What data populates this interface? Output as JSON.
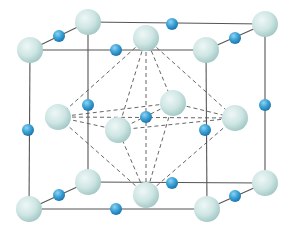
{
  "diagram": {
    "type": "crystal-unit-cell",
    "colors": {
      "background": "#ffffff",
      "cell_edge": "#555555",
      "dashed_line": "#555555",
      "large_atom": "#cfe6e4",
      "large_atom_shade": "#9fc6c4",
      "small_atom": "#3aa2d6",
      "small_atom_shade": "#1b6fa8"
    },
    "cube": {
      "front": {
        "tl": [
          30,
          50
        ],
        "tr": [
          206,
          50
        ],
        "bl": [
          29,
          209
        ],
        "br": [
          207,
          209
        ]
      },
      "back": {
        "tl": [
          88,
          22
        ],
        "tr": [
          265,
          24
        ],
        "bl": [
          88,
          182
        ],
        "br": [
          265,
          183
        ]
      }
    },
    "large_atoms": [
      {
        "name": "corner-back-top-left",
        "x": 88,
        "y": 22,
        "r": 13
      },
      {
        "name": "corner-back-top-right",
        "x": 265,
        "y": 24,
        "r": 13
      },
      {
        "name": "face-top-center",
        "x": 146,
        "y": 38,
        "r": 13
      },
      {
        "name": "corner-front-top-left",
        "x": 30,
        "y": 50,
        "r": 13
      },
      {
        "name": "corner-front-top-right",
        "x": 206,
        "y": 50,
        "r": 13
      },
      {
        "name": "face-back-center",
        "x": 173,
        "y": 103,
        "r": 13
      },
      {
        "name": "face-left-center",
        "x": 58,
        "y": 117,
        "r": 13
      },
      {
        "name": "face-right-center",
        "x": 235,
        "y": 118,
        "r": 13
      },
      {
        "name": "face-front-center",
        "x": 118,
        "y": 130,
        "r": 13
      },
      {
        "name": "corner-back-bottom-left",
        "x": 88,
        "y": 182,
        "r": 13
      },
      {
        "name": "corner-back-bottom-right",
        "x": 265,
        "y": 183,
        "r": 13
      },
      {
        "name": "face-bottom-center",
        "x": 146,
        "y": 195,
        "r": 13
      },
      {
        "name": "corner-front-bottom-left",
        "x": 29,
        "y": 209,
        "r": 13
      },
      {
        "name": "corner-front-bottom-right",
        "x": 207,
        "y": 209,
        "r": 13
      }
    ],
    "small_atoms": [
      {
        "name": "edge-top-back",
        "x": 172,
        "y": 24,
        "r": 6
      },
      {
        "name": "edge-top-left",
        "x": 59,
        "y": 36,
        "r": 6
      },
      {
        "name": "edge-top-right",
        "x": 235,
        "y": 38,
        "r": 6
      },
      {
        "name": "edge-top-front",
        "x": 116,
        "y": 50,
        "r": 6
      },
      {
        "name": "edge-back-left-vertical",
        "x": 88,
        "y": 105,
        "r": 6
      },
      {
        "name": "edge-back-right-vertical",
        "x": 265,
        "y": 105,
        "r": 6
      },
      {
        "name": "body-center",
        "x": 146,
        "y": 117,
        "r": 6
      },
      {
        "name": "edge-front-left-vertical",
        "x": 28,
        "y": 130,
        "r": 6
      },
      {
        "name": "edge-front-right-vertical",
        "x": 205,
        "y": 130,
        "r": 6
      },
      {
        "name": "edge-bottom-back",
        "x": 172,
        "y": 183,
        "r": 6
      },
      {
        "name": "edge-bottom-left",
        "x": 59,
        "y": 195,
        "r": 6
      },
      {
        "name": "edge-bottom-right",
        "x": 235,
        "y": 196,
        "r": 6
      },
      {
        "name": "edge-bottom-front",
        "x": 116,
        "y": 209,
        "r": 6
      }
    ],
    "octahedron": {
      "top": [
        146,
        38
      ],
      "bottom": [
        146,
        195
      ],
      "equator": [
        [
          58,
          117
        ],
        [
          173,
          103
        ],
        [
          235,
          118
        ],
        [
          118,
          130
        ]
      ]
    }
  }
}
